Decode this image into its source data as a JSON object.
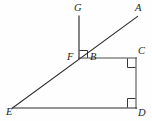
{
  "figure": {
    "background_color": "#fefefe",
    "stroke_color": "#2b2b2b",
    "width": 152,
    "height": 121
  },
  "labels": {
    "G": "G",
    "A": "A",
    "F": "F",
    "B": "B",
    "C": "C",
    "E": "E",
    "D": "D"
  },
  "points": {
    "G": {
      "x": 79,
      "y": 16
    },
    "A": {
      "x": 137,
      "y": 17
    },
    "F": {
      "x": 79,
      "y": 58
    },
    "B": {
      "x": 86,
      "y": 58
    },
    "C": {
      "x": 136,
      "y": 58
    },
    "E": {
      "x": 13,
      "y": 108
    },
    "D": {
      "x": 136,
      "y": 108
    }
  },
  "segments": [
    {
      "name": "ray-GF",
      "from": "G",
      "to": "F"
    },
    {
      "name": "ray-EA",
      "from": "E",
      "to": "A"
    },
    {
      "name": "segment-FC",
      "from": "F",
      "to": "C"
    },
    {
      "name": "segment-CD",
      "from": "C",
      "to": "D"
    },
    {
      "name": "segment-ED",
      "from": "E",
      "to": "D"
    }
  ],
  "right_angles": [
    {
      "name": "right-angle-at-B",
      "vertex": "B"
    },
    {
      "name": "right-angle-at-C",
      "vertex": "C"
    },
    {
      "name": "right-angle-at-D",
      "vertex": "D"
    }
  ]
}
